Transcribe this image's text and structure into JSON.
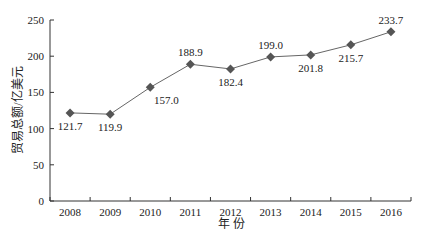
{
  "chart_data": {
    "type": "line",
    "title": "",
    "xlabel": "年 份",
    "ylabel": "贸易总额/亿美元",
    "categories": [
      "2008",
      "2009",
      "2010",
      "2011",
      "2012",
      "2013",
      "2014",
      "2015",
      "2016"
    ],
    "series": [
      {
        "name": "贸易总额",
        "values": [
          121.7,
          119.9,
          157.0,
          188.9,
          182.4,
          199.0,
          201.8,
          215.7,
          233.7
        ],
        "labels": [
          "121.7",
          "119.9",
          "157.0",
          "188.9",
          "182.4",
          "199.0",
          "201.8",
          "215.7",
          "233.7"
        ],
        "label_positions": [
          "below",
          "below",
          "below",
          "above",
          "below",
          "above",
          "below",
          "below",
          "above"
        ],
        "color": "#666666",
        "marker": "diamond"
      }
    ],
    "yticks": [
      0,
      50,
      100,
      150,
      200,
      250
    ],
    "ylim": [
      0,
      250
    ],
    "grid": false,
    "legend": "none"
  }
}
